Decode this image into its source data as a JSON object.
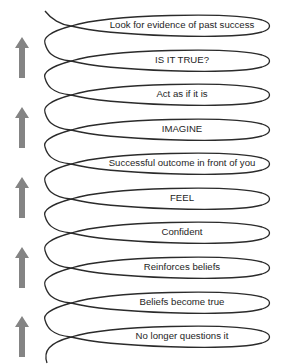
{
  "diagram": {
    "title": "",
    "steps": [
      {
        "label": "Look for evidence of past success",
        "y": 25
      },
      {
        "label": "IS IT TRUE?",
        "y": 60
      },
      {
        "label": "Act as if it is",
        "y": 94
      },
      {
        "label": "IMAGINE",
        "y": 129
      },
      {
        "label": "Successful outcome in front of you",
        "y": 163
      },
      {
        "label": "FEEL",
        "y": 198
      },
      {
        "label": "Confident",
        "y": 232
      },
      {
        "label": "Reinforces beliefs",
        "y": 267
      },
      {
        "label": "Beliefs become true",
        "y": 302
      },
      {
        "label": "No longer questions it",
        "y": 336
      }
    ],
    "arrows": [
      {
        "icon": "up-arrow-icon",
        "top": 37
      },
      {
        "icon": "up-arrow-icon",
        "top": 107
      },
      {
        "icon": "up-arrow-icon",
        "top": 177
      },
      {
        "icon": "up-arrow-icon",
        "top": 247
      },
      {
        "icon": "up-arrow-icon",
        "top": 316
      }
    ],
    "colors": {
      "line": "#2b2b2b",
      "arrow": "#848484",
      "text": "#1e1e1e",
      "background": "#ffffff"
    }
  }
}
